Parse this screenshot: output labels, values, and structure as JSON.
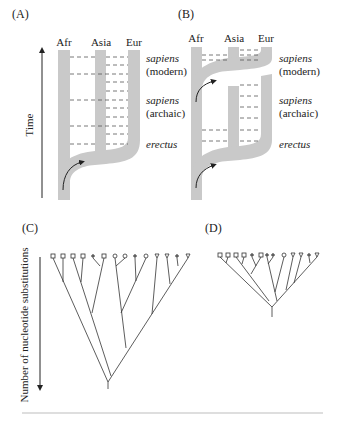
{
  "figure": {
    "panels": {
      "A": {
        "label": "(A)",
        "model": "multiregional",
        "columns": [
          "Afr",
          "Asia",
          "Eur"
        ],
        "axis_label": "Time",
        "eras": [
          {
            "name": "sapiens",
            "qualifier": "(modern)"
          },
          {
            "name": "sapiens",
            "qualifier": "(archaic)"
          },
          {
            "name": "erectus",
            "qualifier": ""
          }
        ]
      },
      "B": {
        "label": "(B)",
        "model": "out-of-africa replacement",
        "columns": [
          "Afr",
          "Asia",
          "Eur"
        ],
        "eras": [
          {
            "name": "sapiens",
            "qualifier": "(modern)"
          },
          {
            "name": "sapiens",
            "qualifier": "(archaic)"
          },
          {
            "name": "erectus",
            "qualifier": ""
          }
        ]
      },
      "C": {
        "label": "(C)",
        "axis_label": "Number of nucleotide substitutions",
        "tips": [
          "square",
          "square",
          "square",
          "square",
          "dot",
          "square",
          "circle",
          "circle",
          "dot",
          "circle",
          "triangle",
          "triangle",
          "dot",
          "triangle"
        ]
      },
      "D": {
        "label": "(D)",
        "tips": [
          "square",
          "square",
          "square",
          "square",
          "dot",
          "square",
          "dot",
          "dot",
          "circle",
          "triangle",
          "triangle",
          "dot",
          "triangle"
        ]
      }
    },
    "colors": {
      "band": "#c9c9c9",
      "line": "#333333",
      "dash": "#555555",
      "rule": "#bdbdbd"
    }
  }
}
